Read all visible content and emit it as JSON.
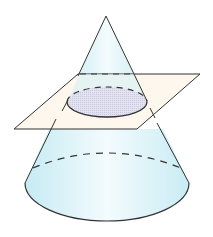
{
  "figure": {
    "colors": {
      "cone_fill": "#d4f0f6",
      "cone_fill_light": "#f2fbfd",
      "plane_fill": "#fdf6ea",
      "section_fill": "#dcdcee",
      "stroke": "#333333"
    }
  }
}
